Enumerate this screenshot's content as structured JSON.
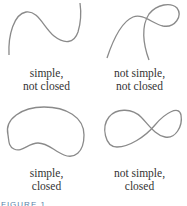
{
  "panels": [
    {
      "id": "simple-not-closed",
      "line1": "simple,",
      "line2": "not closed"
    },
    {
      "id": "not-simple-not-closed",
      "line1": "not simple,",
      "line2": "not closed"
    },
    {
      "id": "simple-closed",
      "line1": "simple,",
      "line2": "closed"
    },
    {
      "id": "not-simple-closed",
      "line1": "not simple,",
      "line2": "closed"
    }
  ],
  "caption": "FIGURE 1",
  "colors": {
    "curve": "#8a8a8a",
    "text": "#333333",
    "caption": "#5a7fa8"
  }
}
